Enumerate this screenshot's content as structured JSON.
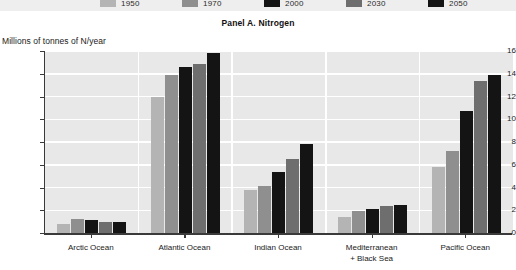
{
  "panel": {
    "title": "Panel A. Nitrogen"
  },
  "axis": {
    "y_caption": "Millions of tonnes of N/year",
    "y_ticks": [
      "16",
      "14",
      "12",
      "10",
      "8",
      "6",
      "4",
      "2",
      "0"
    ]
  },
  "legend": {
    "items": [
      {
        "label": "1950",
        "color": "#b4b4b4"
      },
      {
        "label": "1970",
        "color": "#8f8f8f"
      },
      {
        "label": "2000",
        "color": "#141414"
      },
      {
        "label": "2030",
        "color": "#6e6e6e"
      },
      {
        "label": "2050",
        "color": "#141414"
      }
    ]
  },
  "chart_data": {
    "type": "bar",
    "title": "Panel A. Nitrogen",
    "xlabel": "",
    "ylabel": "Millions of tonnes of N/year",
    "ylim": [
      0,
      16
    ],
    "ytick_step": 2,
    "grid": true,
    "legend_position": "top",
    "categories": [
      "Arctic Ocean",
      "Atlantic Ocean",
      "Indian Ocean",
      "Mediterranean\n+ Black Sea",
      "Pacific Ocean"
    ],
    "series": [
      {
        "name": "1950",
        "color": "#b4b4b4",
        "values": [
          0.8,
          12.0,
          3.8,
          1.4,
          5.8
        ]
      },
      {
        "name": "1970",
        "color": "#8f8f8f",
        "values": [
          1.2,
          13.9,
          4.1,
          1.9,
          7.2
        ]
      },
      {
        "name": "2000",
        "color": "#141414",
        "values": [
          1.15,
          14.6,
          5.4,
          2.1,
          10.7
        ]
      },
      {
        "name": "2030",
        "color": "#6e6e6e",
        "values": [
          0.95,
          14.9,
          6.5,
          2.35,
          13.4
        ]
      },
      {
        "name": "2050",
        "color": "#141414",
        "values": [
          1.0,
          15.8,
          7.8,
          2.5,
          13.9
        ]
      }
    ]
  }
}
